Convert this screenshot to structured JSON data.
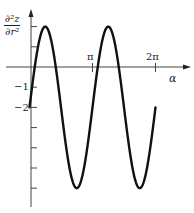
{
  "chart_data": {
    "type": "line",
    "title": "",
    "xlabel": "α",
    "ylabel": "∂²z/∂r²",
    "ylabel_num": "∂²z",
    "ylabel_den": "∂r²",
    "x_tick_labels": [
      "π",
      "2π"
    ],
    "x_ticks": [
      3.14159,
      6.28319
    ],
    "y_tick_labels": [
      "−1",
      "−2"
    ],
    "y_ticks": [
      2,
      1,
      -1,
      -2,
      -3,
      -4,
      -5,
      -6
    ],
    "xlim": [
      0,
      6.9
    ],
    "ylim": [
      -6.9,
      2.7
    ],
    "grid": false,
    "legend": null,
    "series": [
      {
        "name": "∂²z/∂r² = −2 + 4 sin 2α",
        "formula": "-2 + 4*sin(2*alpha)",
        "x": [
          0,
          0.3927,
          0.7854,
          1.1781,
          1.5708,
          1.9635,
          2.3562,
          2.7489,
          3.1416,
          3.5343,
          3.927,
          4.3197,
          4.7124,
          5.1051,
          5.4978,
          5.8905,
          6.2832
        ],
        "values": [
          -2,
          0.83,
          2,
          0.83,
          -2,
          -4.83,
          -6,
          -4.83,
          -2,
          0.83,
          2,
          0.83,
          -2,
          -4.83,
          -6,
          -4.83,
          -2
        ]
      }
    ],
    "colors": {
      "curve": "#111111",
      "axes": "#444444"
    }
  }
}
